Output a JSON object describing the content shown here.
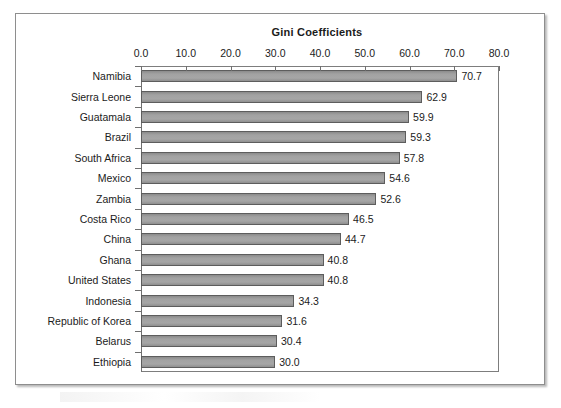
{
  "chart_data": {
    "type": "bar",
    "orientation": "horizontal",
    "title": "Gini Coefficients",
    "xlabel": "",
    "ylabel": "",
    "xlim": [
      0,
      80
    ],
    "xticks": [
      "0.0",
      "10.0",
      "20.0",
      "30.0",
      "40.0",
      "50.0",
      "60.0",
      "70.0",
      "80.0"
    ],
    "xtick_values": [
      0,
      10,
      20,
      30,
      40,
      50,
      60,
      70,
      80
    ],
    "grid": false,
    "legend": false,
    "data_labels": true,
    "categories": [
      "Namibia",
      "Sierra Leone",
      "Guatamala",
      "Brazil",
      "South Africa",
      "Mexico",
      "Zambia",
      "Costa Rico",
      "China",
      "Ghana",
      "United States",
      "Indonesia",
      "Republic of Korea",
      "Belarus",
      "Ethiopia"
    ],
    "values": [
      70.7,
      62.9,
      59.9,
      59.3,
      57.8,
      54.6,
      52.6,
      46.5,
      44.7,
      40.8,
      40.8,
      34.3,
      31.6,
      30.4,
      30.0
    ],
    "value_labels": [
      "70.7",
      "62.9",
      "59.9",
      "59.3",
      "57.8",
      "54.6",
      "52.6",
      "46.5",
      "44.7",
      "40.8",
      "40.8",
      "34.3",
      "31.6",
      "30.4",
      "30.0"
    ],
    "colors": {
      "bar_fill": "#9a9a9a",
      "bar_border": "#5d5d5d",
      "axis": "#6f6f6f",
      "text": "#1b1b1b",
      "background": "#ffffff",
      "frame": "#8e8e8e"
    }
  }
}
